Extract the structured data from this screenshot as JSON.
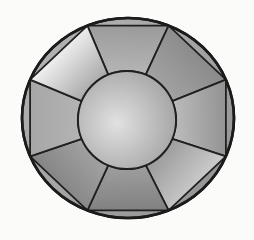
{
  "figure": {
    "background_color": "#fbfbf9",
    "line_color": "#1b1b1b",
    "geometry": {
      "canvas": {
        "width": 254,
        "height": 240
      },
      "outer_ellipse": {
        "cx": 128,
        "cy": 118,
        "rx": 106,
        "ry": 100,
        "stroke_width": 2.6
      },
      "octagon_vertex_angles_deg": [
        112.5,
        67.5,
        22.5,
        -22.5,
        -67.5,
        -112.5,
        -157.5,
        157.5
      ],
      "inner_circle": {
        "cx": 127,
        "cy": 120,
        "r": 49,
        "stroke_width": 1.8
      },
      "facet_line_width": 1.8
    },
    "shading": {
      "rim_gradient": {
        "from": "#b2b2b2",
        "to": "#949494"
      },
      "table_gradient": {
        "center": "#e3e3e3",
        "edge": "#a2a2a2"
      },
      "facets": [
        {
          "name": "top",
          "outer": "#9a9a9a",
          "inner": "#b6b6b6"
        },
        {
          "name": "upper-right",
          "outer": "#8a8a8a",
          "inner": "#a2a2a2"
        },
        {
          "name": "right",
          "outer": "#929292",
          "inner": "#bdbdbd"
        },
        {
          "name": "lower-right",
          "outer": "#c9c9c9",
          "inner": "#9a9a9a"
        },
        {
          "name": "bottom",
          "outer": "#7f7f7f",
          "inner": "#9e9e9e"
        },
        {
          "name": "lower-left",
          "outer": "#858585",
          "inner": "#a2a2a2"
        },
        {
          "name": "left",
          "outer": "#a6a6a6",
          "inner": "#b4b4b4"
        },
        {
          "name": "upper-left",
          "outer": "#f1f1f1",
          "inner": "#a8a8a8"
        }
      ],
      "grain_opacity": 0.08
    }
  }
}
